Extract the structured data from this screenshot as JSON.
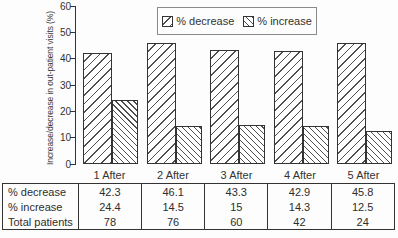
{
  "chart_data": {
    "type": "bar",
    "categories": [
      "1 After",
      "2 After",
      "3 After",
      "4 After",
      "5 After"
    ],
    "series": [
      {
        "name": "% decrease",
        "values": [
          42.3,
          46.1,
          43.3,
          42.9,
          45.8
        ],
        "hatch": "forward-slash"
      },
      {
        "name": "% increase",
        "values": [
          24.4,
          14.5,
          15,
          14.3,
          12.5
        ],
        "hatch": "back-slash"
      }
    ],
    "title": "",
    "xlabel": "",
    "ylabel": "Increase/decrease in out-patient visits (%)",
    "ylim": [
      0,
      60
    ],
    "yticks": [
      0,
      10,
      20,
      30,
      40,
      50,
      60
    ],
    "grid": false,
    "legend_position": "top-center"
  },
  "table": {
    "rows": [
      {
        "label": "% decrease",
        "values": [
          "42.3",
          "46.1",
          "43.3",
          "42.9",
          "45.8"
        ]
      },
      {
        "label": "% increase",
        "values": [
          "24.4",
          "14.5",
          "15",
          "14.3",
          "12.5"
        ]
      },
      {
        "label": "Total patients",
        "values": [
          "78",
          "76",
          "60",
          "42",
          "24"
        ]
      }
    ]
  },
  "colors": {
    "ink": "#333333",
    "background": "#fdfdfd",
    "hatch": "#4f4f4f"
  }
}
